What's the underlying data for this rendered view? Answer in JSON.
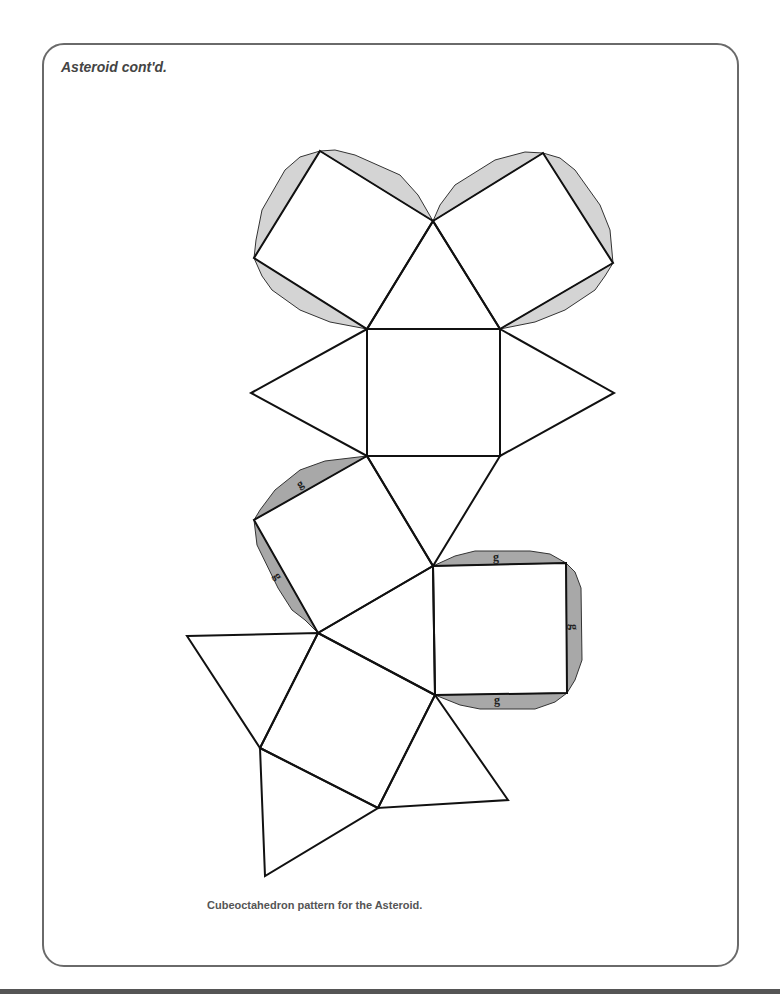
{
  "page": {
    "title": "Asteroid cont'd.",
    "caption": "Cubeoctahedron pattern for the Asteroid."
  },
  "figure": {
    "name": "Cubeoctahedron net",
    "faces": {
      "squares": 6,
      "triangles": 8
    },
    "glue_tab_label": "g",
    "glue_tab_labels": [
      "g",
      "g",
      "g",
      "g",
      "g"
    ],
    "colors": {
      "line": "#111111",
      "tab_light": "#d4d4d4",
      "tab_dark": "#a8a8a8",
      "frame": "#6a6a6a"
    }
  }
}
